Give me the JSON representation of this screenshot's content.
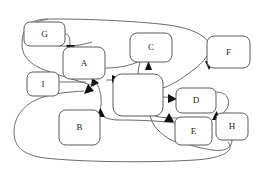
{
  "diagram": {
    "type": "directed-graph",
    "node_shape": "rounded-rectangle",
    "node_fill": "#ffffff",
    "node_stroke": "#5a5a5a",
    "edge_stroke": "#6b6b6b",
    "arrowhead_fill": "#111111",
    "canvas": {
      "width": 265,
      "height": 169
    },
    "nodes": [
      {
        "id": "G",
        "label": "G",
        "x": 24,
        "y": 22,
        "w": 41,
        "h": 24,
        "cx": 44.5,
        "cy": 34
      },
      {
        "id": "A",
        "label": "A",
        "x": 63,
        "y": 47,
        "w": 42,
        "h": 32,
        "cx": 84,
        "cy": 63
      },
      {
        "id": "I",
        "label": "I",
        "x": 27,
        "y": 72,
        "w": 32,
        "h": 24,
        "cx": 43,
        "cy": 84
      },
      {
        "id": "C",
        "label": "C",
        "x": 130,
        "y": 33,
        "w": 42,
        "h": 29,
        "cx": 151,
        "cy": 47.5
      },
      {
        "id": "F",
        "label": "F",
        "x": 207,
        "y": 36,
        "w": 43,
        "h": 32,
        "cx": 228.5,
        "cy": 52
      },
      {
        "id": "CENTER",
        "label": "",
        "x": 113,
        "y": 74,
        "w": 50,
        "h": 42,
        "cx": 138,
        "cy": 95
      },
      {
        "id": "B",
        "label": "B",
        "x": 59,
        "y": 110,
        "w": 41,
        "h": 35,
        "cx": 79.5,
        "cy": 127.5
      },
      {
        "id": "D",
        "label": "D",
        "x": 176,
        "y": 88,
        "w": 40,
        "h": 25,
        "cx": 196,
        "cy": 100.5
      },
      {
        "id": "E",
        "label": "E",
        "x": 175,
        "y": 117,
        "w": 37,
        "h": 28,
        "cx": 193.5,
        "cy": 131
      },
      {
        "id": "H",
        "label": "H",
        "x": 216,
        "y": 113,
        "w": 32,
        "h": 27,
        "cx": 232,
        "cy": 126.5
      }
    ],
    "edges": [
      {
        "from": "I",
        "to": "G_RIGHT",
        "name": "edge-to-a-top"
      },
      {
        "from": "outer-top",
        "to": "A_TOP",
        "name": "edge-outer-top-to-a"
      },
      {
        "from": "G",
        "to": "A_LEFT",
        "name": "edge-g-to-a-left"
      },
      {
        "from": "A",
        "to": "C",
        "name": "edge-a-to-c"
      },
      {
        "from": "A",
        "to": "CENTER",
        "name": "edge-a-to-center"
      },
      {
        "from": "CENTER",
        "to": "F",
        "name": "edge-center-to-f"
      },
      {
        "from": "CENTER",
        "to": "D",
        "name": "edge-center-to-d"
      },
      {
        "from": "D",
        "to": "H",
        "name": "edge-d-to-h"
      },
      {
        "from": "H",
        "to": "E",
        "name": "edge-h-to-e"
      },
      {
        "from": "CENTER",
        "to": "E_TOP",
        "name": "edge-center-to-e"
      },
      {
        "from": "E",
        "to": "B",
        "name": "edge-e-to-b"
      },
      {
        "from": "outer-bottom",
        "to": "I_BOTTOM",
        "name": "edge-outer-bottom-to-i"
      }
    ]
  }
}
